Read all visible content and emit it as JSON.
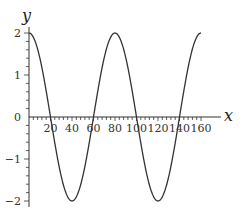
{
  "chart_data": {
    "type": "line",
    "title": "",
    "xlabel": "x",
    "ylabel": "y",
    "function": "y = 2cos(2πx/80)",
    "xlim": [
      0,
      160
    ],
    "ylim": [
      -2,
      2
    ],
    "x_ticks": [
      20,
      40,
      60,
      80,
      100,
      120,
      140,
      160
    ],
    "x_tick_labels": [
      "20",
      "40",
      "60",
      "80",
      "100",
      "120",
      "140",
      "160"
    ],
    "y_ticks": [
      -2,
      -1,
      0,
      1,
      2
    ],
    "y_tick_labels": [
      "−2",
      "−1",
      "0",
      "1",
      "2"
    ],
    "grid": false,
    "legend": null,
    "series": [
      {
        "name": "y",
        "color": "#333333",
        "x": [
          0,
          10,
          20,
          30,
          40,
          50,
          60,
          70,
          80,
          90,
          100,
          110,
          120,
          130,
          140,
          150,
          160
        ],
        "values": [
          2,
          1.41,
          0,
          -1.41,
          -2,
          -1.41,
          0,
          1.41,
          2,
          1.41,
          0,
          -1.41,
          -2,
          -1.41,
          0,
          1.41,
          2
        ]
      }
    ],
    "annotations": {
      "maxima_x": [
        0,
        80,
        160
      ],
      "minima_x": [
        40,
        120
      ],
      "zeros_x": [
        20,
        60,
        100,
        140
      ]
    }
  }
}
